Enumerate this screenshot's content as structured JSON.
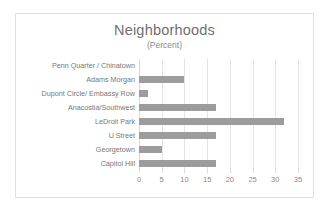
{
  "chart_data": {
    "type": "bar",
    "orientation": "horizontal",
    "title": "Neighborhoods",
    "subtitle": "(Percent)",
    "xlabel": "",
    "ylabel": "",
    "xlim": [
      0,
      35
    ],
    "xticks": [
      0,
      5,
      10,
      15,
      20,
      25,
      30,
      35
    ],
    "grid": true,
    "legend": false,
    "bar_color": "#9c9c9c",
    "categories": [
      "Penn Quarter / Chinatown",
      "Adams Morgan",
      "Dupont Circle/ Embassy Row",
      "Anacostia/Southwest",
      "LeDroit Park",
      "U Street",
      "Georgetown",
      "Capitol Hill"
    ],
    "values": [
      0,
      10,
      2,
      17,
      32,
      17,
      5,
      17
    ]
  }
}
